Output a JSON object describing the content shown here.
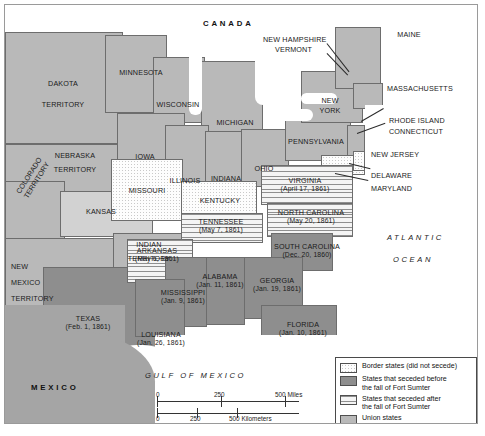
{
  "map": {
    "title": "Secession of the Southern States, 1860-1861",
    "countries": [
      {
        "name": "CANADA"
      },
      {
        "name": "MEXICO"
      }
    ],
    "waters": [
      {
        "name": "ATLANTIC"
      },
      {
        "name": "OCEAN"
      },
      {
        "name": "GULF OF MEXICO"
      }
    ],
    "regions": {
      "dakota_territory_1": "DAKOTA",
      "dakota_territory_2": "TERRITORY",
      "nebraska_territory_1": "NEBRASKA",
      "nebraska_territory_2": "TERRITORY",
      "colorado_territory_1": "COLORADO",
      "colorado_territory_2": "TERRITORY",
      "new_mexico_territory_1": "NEW",
      "new_mexico_territory_2": "MEXICO",
      "new_mexico_territory_3": "TERRITORY",
      "indian_territory_1": "INDIAN",
      "indian_territory_2": "TERRITORY",
      "kansas": "KANSAS",
      "minnesota": "MINNESOTA",
      "wisconsin": "WISCONSIN",
      "iowa": "IOWA",
      "illinois": "ILLINOIS",
      "indiana": "INDIANA",
      "michigan": "MICHIGAN",
      "ohio": "OHIO",
      "pennsylvania": "PENNSYLVANIA",
      "new_york": "NEW",
      "new_york2": "YORK",
      "maine": "MAINE",
      "new_hampshire": "NEW HAMPSHIRE",
      "vermont": "VERMONT",
      "massachusetts": "MASSACHUSETTS",
      "rhode_island": "RHODE ISLAND",
      "connecticut": "CONNECTICUT",
      "new_jersey": "NEW JERSEY",
      "delaware": "DELAWARE",
      "maryland": "MARYLAND",
      "missouri": "MISSOURI",
      "kentucky": "KENTUCKY"
    },
    "seceded_states": [
      {
        "name": "VIRGINIA",
        "date": "(April 17, 1861)",
        "group": "after"
      },
      {
        "name": "NORTH CAROLINA",
        "date": "(May 20, 1861)",
        "group": "after"
      },
      {
        "name": "TENNESSEE",
        "date": "(May 7, 1861)",
        "group": "after"
      },
      {
        "name": "ARKANSAS",
        "date": "(May 6, 1861)",
        "group": "after"
      },
      {
        "name": "SOUTH CAROLINA",
        "date": "(Dec. 20, 1860)",
        "group": "before"
      },
      {
        "name": "GEORGIA",
        "date": "(Jan. 19, 1861)",
        "group": "before"
      },
      {
        "name": "ALABAMA",
        "date": "(Jan. 11, 1861)",
        "group": "before"
      },
      {
        "name": "MISSISSIPPI",
        "date": "(Jan. 9, 1861)",
        "group": "before"
      },
      {
        "name": "LOUISIANA",
        "date": "(Jan. 26, 1861)",
        "group": "before"
      },
      {
        "name": "FLORIDA",
        "date": "(Jan. 10, 1861)",
        "group": "before"
      },
      {
        "name": "TEXAS",
        "date": "(Feb. 1, 1861)",
        "group": "before"
      }
    ],
    "legend": {
      "items": [
        {
          "swatch": "border",
          "label": "Border states (did not secede)"
        },
        {
          "swatch": "before",
          "label": "States that seceded before\nthe fall of Fort Sumter"
        },
        {
          "swatch": "after",
          "label": "States that seceded after\nthe fall of Fort Sumter"
        },
        {
          "swatch": "union",
          "label": "Union states"
        }
      ]
    },
    "scale": {
      "miles": {
        "zero": "0",
        "mid": "250",
        "end": "500 Miles"
      },
      "kilometers": {
        "zero": "0",
        "mid": "250",
        "end": "500 Kilometers"
      }
    },
    "colors": {
      "union": "#b9b9b9",
      "confederate_before": "#8e8e8e",
      "seceded_after": "#efefef",
      "border_states": "#fdfdfd",
      "frame": "#9a9a9a"
    }
  }
}
